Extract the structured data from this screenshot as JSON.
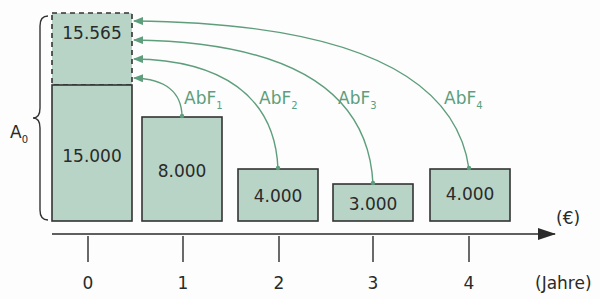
{
  "diagram": {
    "bars": [
      {
        "period": "0",
        "value_label": "15.000",
        "value": 15000
      },
      {
        "period": "1",
        "value_label": "8.000",
        "value": 8000
      },
      {
        "period": "2",
        "value_label": "4.000",
        "value": 4000
      },
      {
        "period": "3",
        "value_label": "3.000",
        "value": 3000
      },
      {
        "period": "4",
        "value_label": "4.000",
        "value": 4000
      }
    ],
    "extra_box": {
      "value_label": "15.565",
      "value": 15565
    },
    "brace_label": "A",
    "brace_label_sub": "0",
    "arrows": [
      {
        "label": "AbF",
        "sub": "1",
        "from_period": "1"
      },
      {
        "label": "AbF",
        "sub": "2",
        "from_period": "2"
      },
      {
        "label": "AbF",
        "sub": "3",
        "from_period": "3"
      },
      {
        "label": "AbF",
        "sub": "4",
        "from_period": "4"
      }
    ],
    "axis": {
      "unit_label": "(€)",
      "x_unit_label": "(Jahre)",
      "ticks": [
        "0",
        "1",
        "2",
        "3",
        "4"
      ]
    },
    "colors": {
      "bar_fill": "#b8d4c6",
      "bar_stroke": "#3a3a3a",
      "arrow": "#5e9e7c",
      "text": "#2a2a2a"
    }
  }
}
